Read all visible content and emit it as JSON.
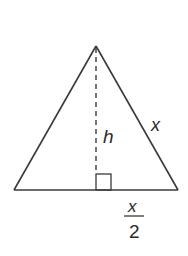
{
  "diagram": {
    "type": "isosceles-triangle-height",
    "colors": {
      "stroke": "#3a3a3a",
      "text": "#2a2a2a",
      "background": "#ffffff"
    },
    "labels": {
      "height": "h",
      "side": "x",
      "half_base_numerator": "x",
      "half_base_denominator": "2"
    }
  }
}
